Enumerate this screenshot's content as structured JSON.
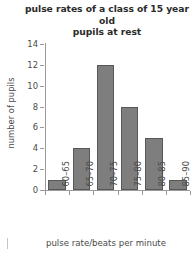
{
  "chart_data": {
    "type": "bar",
    "title": "pulse rates of a class of 15 year old pupils at rest",
    "title_lines": [
      "pulse rates of a class of 15 year old",
      "pupils at rest"
    ],
    "xlabel": "pulse rate/beats per minute",
    "ylabel": "number of pupils",
    "categories": [
      "60–65",
      "65–70",
      "70–75",
      "75–80",
      "80–85",
      "85–90"
    ],
    "values": [
      1,
      4,
      12,
      8,
      5,
      1
    ],
    "ylim": [
      0,
      14
    ],
    "ytick_values": [
      0,
      2,
      4,
      6,
      8,
      10,
      12,
      14
    ],
    "ytick_labels": [
      "0",
      "2",
      "4",
      "6",
      "8",
      "10",
      "12",
      "14"
    ],
    "grid": false,
    "legend": false,
    "bar_color": "#7e7e7e",
    "bar_edge_color": "#575757",
    "axis_color": "#9a9a9a",
    "text_color": "#4a4a4a"
  }
}
